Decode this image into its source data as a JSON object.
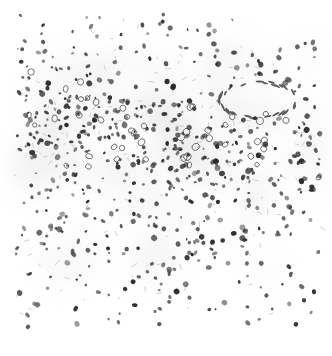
{
  "image": {
    "kind": "histology-micrograph",
    "description": "Grayscale light micrograph of tissue section showing densely packed dark-staining nuclei with a dense cellular band across the upper-middle region, sparser cellularity toward the top and bottom edges, and a clear vessel lumen in the upper right.",
    "colors": {
      "background": "#ffffff",
      "nucleus_dark": "#2a2a2a",
      "nucleus_mid": "#5a5a5a",
      "stroma": "#bdbdbd",
      "haze": "#d9d9d9"
    },
    "regions": [
      {
        "name": "sparse-top",
        "density": 0.25
      },
      {
        "name": "dense-band",
        "density": 1.0
      },
      {
        "name": "vessel-lumen",
        "density": 0.0
      },
      {
        "name": "mixed-middle",
        "density": 0.7
      },
      {
        "name": "sparse-bottom",
        "density": 0.3
      }
    ]
  }
}
